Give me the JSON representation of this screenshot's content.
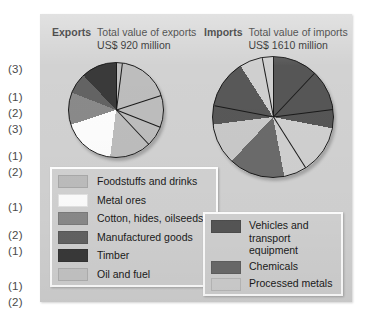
{
  "margin_marks": [
    {
      "label": "(3)",
      "top": 63
    },
    {
      "label": "(1)",
      "top": 91
    },
    {
      "label": "(2)",
      "top": 107
    },
    {
      "label": "(3)",
      "top": 123
    },
    {
      "label": "(1)",
      "top": 150
    },
    {
      "label": "(2)",
      "top": 166
    },
    {
      "label": "(1)",
      "top": 201
    },
    {
      "label": "(2)",
      "top": 229
    },
    {
      "label": "(1)",
      "top": 245
    },
    {
      "label": "(1)",
      "top": 280
    },
    {
      "label": "(2)",
      "top": 296
    }
  ],
  "exports": {
    "heading": "Exports",
    "subtitle_line1": "Total value of exports",
    "subtitle_line2": "US$ 920 million",
    "legend": [
      {
        "label": "Foodstuffs and drinks",
        "color": "#bdbdbd"
      },
      {
        "label": "Metal ores",
        "color": "#fdfdfd"
      },
      {
        "label": "Cotton, hides, oilseeds",
        "color": "#8a8a8a"
      },
      {
        "label": "Manufactured goods",
        "color": "#636363"
      },
      {
        "label": "Timber",
        "color": "#3a3a3a"
      },
      {
        "label": "Oil and fuel",
        "color": "#c6c6c6"
      }
    ]
  },
  "imports": {
    "heading": "Imports",
    "subtitle_line1": "Total value of imports",
    "subtitle_line2": "US$ 1610 million",
    "legend": [
      {
        "label": "Vehicles and transport equipment",
        "color": "#565656"
      },
      {
        "label": "Chemicals",
        "color": "#6b6b6b"
      },
      {
        "label": "Processed metals",
        "color": "#d0d0d0"
      }
    ]
  },
  "chart_data": [
    {
      "type": "pie",
      "title": "Total value of exports US$ 920 million",
      "unit": "US$ million",
      "total": 920,
      "categories": [
        "Foodstuffs and drinks",
        "Metal ores",
        "Cotton, hides, oilseeds",
        "Manufactured goods",
        "Timber"
      ],
      "values": [
        52,
        18,
        11,
        7,
        12
      ],
      "value_unit": "percent",
      "colors": [
        "#bdbdbd",
        "#fdfdfd",
        "#8a8a8a",
        "#636363",
        "#3a3a3a"
      ],
      "legend_position": "below",
      "start_angle_deg": 0,
      "direction": "clockwise"
    },
    {
      "type": "pie",
      "title": "Total value of imports US$ 1610 million",
      "unit": "US$ million",
      "total": 1610,
      "categories": [
        "Vehicles and transport equipment",
        "Processed metals",
        "Chemicals",
        "Processed metals",
        "Vehicles and transport equipment",
        "Processed metals"
      ],
      "values": [
        28,
        19,
        15,
        11,
        18,
        9
      ],
      "value_unit": "percent",
      "colors": [
        "#565656",
        "#d0d0d0",
        "#6b6b6b",
        "#c9c9c9",
        "#585858",
        "#cfcfcf"
      ],
      "legend_position": "below",
      "start_angle_deg": 0,
      "direction": "clockwise"
    }
  ]
}
